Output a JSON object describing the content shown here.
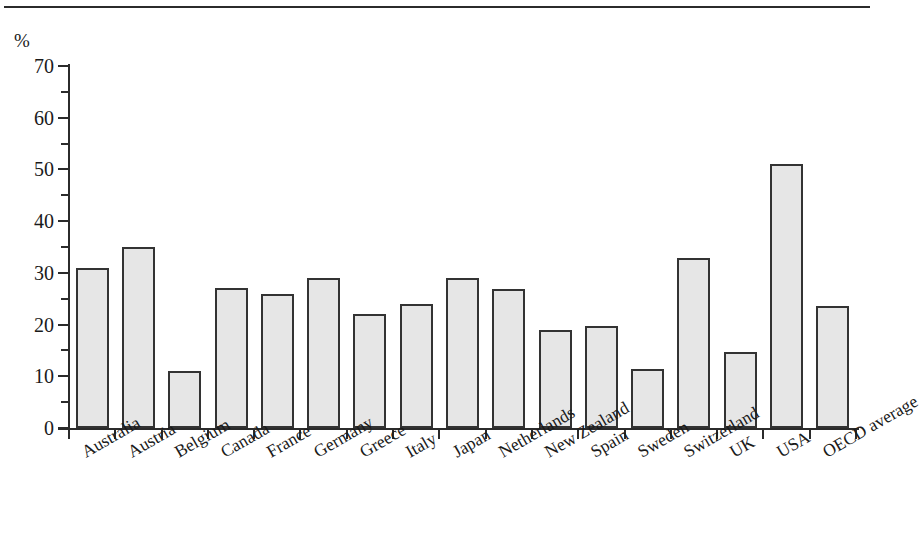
{
  "chart_data": {
    "type": "bar",
    "title": "",
    "subtitle": "",
    "xlabel": "",
    "ylabel": "%",
    "unit_label": "%",
    "ylim": [
      0,
      70
    ],
    "ytick_step": 10,
    "yminor_step": 5,
    "grid": false,
    "legend": null,
    "legend_position": "none",
    "bar_fill_color": "#e6e6e6",
    "bar_border_color": "#333333",
    "axis_color": "#2b2b2b",
    "categories": [
      "Australia",
      "Austria",
      "Belgium",
      "Canada",
      "France",
      "Germany",
      "Greece",
      "Italy",
      "Japan",
      "Netherlands",
      "New Zealand",
      "Spain",
      "Sweden",
      "Switzerland",
      "UK",
      "USA",
      "OECD average"
    ],
    "values": [
      31,
      35,
      11,
      27,
      26,
      29,
      22,
      24,
      29,
      26.8,
      19,
      19.8,
      11.5,
      32.8,
      14.7,
      51,
      23.5
    ],
    "ytick_labels": [
      "0",
      "10",
      "20",
      "30",
      "40",
      "50",
      "60",
      "70"
    ],
    "ytick_values": [
      0,
      10,
      20,
      30,
      40,
      50,
      60,
      70
    ],
    "yminor_values": [
      5,
      15,
      25,
      35,
      45,
      55,
      65
    ]
  }
}
